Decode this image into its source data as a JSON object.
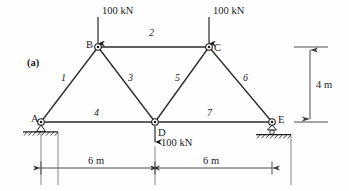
{
  "figure": {
    "part_label": "(a)",
    "type": "truss-free-body-diagram",
    "title_absent": true
  },
  "loads": [
    {
      "id": "load-at-B",
      "label": "100 kN",
      "direction": "down",
      "at_joint": "B"
    },
    {
      "id": "load-at-C",
      "label": "100 kN",
      "direction": "down",
      "at_joint": "C"
    },
    {
      "id": "load-at-D",
      "label": "100 kN",
      "direction": "down",
      "at_joint": "D"
    }
  ],
  "joints": [
    {
      "name": "A",
      "label": "A",
      "x": 41,
      "y": 122,
      "support": "pinned"
    },
    {
      "name": "B",
      "label": "B",
      "x": 98,
      "y": 47,
      "support": "none"
    },
    {
      "name": "C",
      "label": "C",
      "x": 209,
      "y": 47,
      "support": "none"
    },
    {
      "name": "D",
      "label": "D",
      "x": 155,
      "y": 122,
      "support": "none"
    },
    {
      "name": "E",
      "label": "E",
      "x": 272,
      "y": 122,
      "support": "roller"
    }
  ],
  "members": [
    {
      "label": "1",
      "from": "A",
      "to": "B"
    },
    {
      "label": "2",
      "from": "B",
      "to": "C"
    },
    {
      "label": "3",
      "from": "B",
      "to": "D"
    },
    {
      "label": "4",
      "from": "A",
      "to": "D"
    },
    {
      "label": "5",
      "from": "D",
      "to": "C"
    },
    {
      "label": "6",
      "from": "C",
      "to": "E"
    },
    {
      "label": "7",
      "from": "D",
      "to": "E"
    }
  ],
  "dimensions": [
    {
      "id": "span-left",
      "label": "6 m",
      "orientation": "horizontal",
      "from": "A",
      "to": "D"
    },
    {
      "id": "span-right",
      "label": "6 m",
      "orientation": "horizontal",
      "from": "D",
      "to": "E"
    },
    {
      "id": "height",
      "label": "4 m",
      "orientation": "vertical",
      "from": "top-chord",
      "to": "bottom-chord"
    }
  ],
  "colors": {
    "line": "#2b2b2b",
    "text": "#1a1a1a",
    "dimension": "#3a3a3a",
    "background": "#fefefe"
  }
}
